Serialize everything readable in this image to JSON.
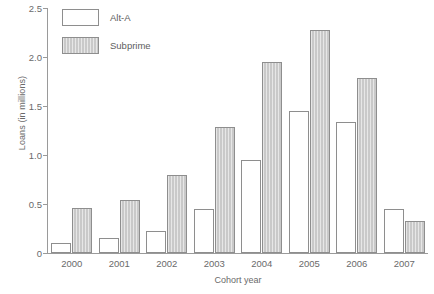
{
  "chart_data": {
    "type": "bar",
    "title": "",
    "subtitle": "",
    "xlabel": "Cohort year",
    "ylabel": "Loans (in millions)",
    "categories": [
      "2000",
      "2001",
      "2002",
      "2003",
      "2004",
      "2005",
      "2006",
      "2007"
    ],
    "series": [
      {
        "name": "Alt-A",
        "fill": "#ffffff",
        "values": [
          0.1,
          0.15,
          0.22,
          0.45,
          0.95,
          1.45,
          1.34,
          0.45
        ]
      },
      {
        "name": "Subprime",
        "fill": "#c9c9c9",
        "values": [
          0.46,
          0.54,
          0.8,
          1.29,
          1.95,
          2.28,
          1.79,
          0.33
        ]
      }
    ],
    "ylim": [
      0,
      2.5
    ],
    "yticks": [
      0,
      0.5,
      1.0,
      1.5,
      2.0,
      2.5
    ],
    "ytick_labels": [
      "0",
      "0.5",
      "1.0",
      "1.5",
      "2.0",
      "2.5"
    ],
    "grid": false,
    "legend_position": "top-left",
    "axis_color": "#9a9a9a",
    "text_color": "#6a6a6a"
  }
}
